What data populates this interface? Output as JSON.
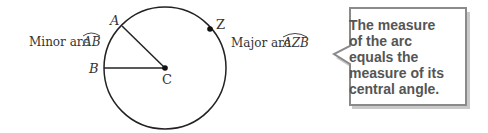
{
  "diagram": {
    "points": {
      "A": "A",
      "B": "B",
      "C": "C",
      "Z": "Z"
    },
    "minor_arc_label": "Minor arc",
    "minor_arc_name": "AB",
    "major_arc_label": "Major arc",
    "major_arc_name": "AZB"
  },
  "callout": {
    "lines": [
      "The measure",
      "of the arc",
      "equals the",
      "measure of its",
      "central angle."
    ]
  },
  "colors": {
    "stroke": "#222222",
    "callout_border": "#8a8a8a",
    "callout_text": "#555555"
  }
}
